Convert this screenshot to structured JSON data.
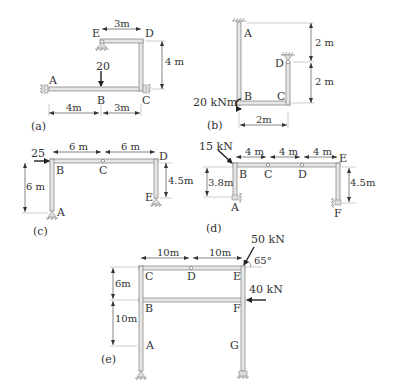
{
  "figures": [
    {
      "id": "a",
      "caption": "(a)",
      "nodes": [
        "A",
        "B",
        "C",
        "D",
        "E"
      ],
      "dimensions": {
        "ED": "3m",
        "CD": "4 m",
        "AB": "4m",
        "BC": "3m"
      },
      "loads": [
        {
          "label": "20",
          "at": "B",
          "direction": "down"
        }
      ]
    },
    {
      "id": "b",
      "caption": "(b)",
      "nodes": [
        "A",
        "B",
        "C",
        "D"
      ],
      "dimensions": {
        "upper": "2 m",
        "lower": "2 m",
        "BC": "2m"
      },
      "loads": [
        {
          "label": "20 kNm",
          "at": "B",
          "type": "moment"
        }
      ]
    },
    {
      "id": "c",
      "caption": "(c)",
      "nodes": [
        "A",
        "B",
        "C",
        "D",
        "E"
      ],
      "dimensions": {
        "BC": "6 m",
        "CD": "6 m",
        "AB": "6 m",
        "DE": "4.5m"
      },
      "loads": [
        {
          "label": "25",
          "at": "B",
          "direction": "right"
        }
      ]
    },
    {
      "id": "d",
      "caption": "(d)",
      "nodes": [
        "A",
        "B",
        "C",
        "D",
        "E",
        "F"
      ],
      "dimensions": {
        "BC": "4 m",
        "CD": "4 m",
        "DE": "4 m",
        "AB": "3.8m",
        "EF": "4.5m"
      },
      "loads": [
        {
          "label": "15 kN",
          "at": "B",
          "direction": "diagonal"
        }
      ]
    },
    {
      "id": "e",
      "caption": "(e)",
      "nodes": [
        "A",
        "B",
        "C",
        "D",
        "E",
        "F",
        "G"
      ],
      "dimensions": {
        "CD": "10m",
        "DE": "10m",
        "BC": "6m",
        "AB": "10m"
      },
      "loads": [
        {
          "label": "50 kN",
          "at": "E",
          "angle": "65°"
        },
        {
          "label": "40 kN",
          "at": "F",
          "direction": "left"
        }
      ]
    }
  ],
  "text": {
    "a": {
      "A": "A",
      "B": "B",
      "C": "C",
      "D": "D",
      "E": "E",
      "d_ed": "3m",
      "d_cd": "4 m",
      "d_ab": "4m",
      "d_bc": "3m",
      "load": "20",
      "cap": "(a)"
    },
    "b": {
      "A": "A",
      "B": "B",
      "C": "C",
      "D": "D",
      "d_top": "2 m",
      "d_bot": "2 m",
      "d_bc": "2m",
      "load": "20 kNm",
      "cap": "(b)"
    },
    "c": {
      "A": "A",
      "B": "B",
      "C": "C",
      "D": "D",
      "E": "E",
      "d_bc": "6 m",
      "d_cd": "6 m",
      "d_ab": "6 m",
      "d_de": "4.5m",
      "load": "25",
      "cap": "(c)"
    },
    "d": {
      "A": "A",
      "B": "B",
      "C": "C",
      "D": "D",
      "E": "E",
      "F": "F",
      "d_bc": "4 m",
      "d_cd": "4 m",
      "d_de": "4 m",
      "d_ab": "3.8m",
      "d_ef": "4.5m",
      "load": "15 kN",
      "cap": "(d)"
    },
    "e": {
      "A": "A",
      "B": "B",
      "C": "C",
      "D": "D",
      "E": "E",
      "F": "F",
      "G": "G",
      "d_cd": "10m",
      "d_de": "10m",
      "d_bc": "6m",
      "d_ab": "10m",
      "load1": "50 kN",
      "angle": "65°",
      "load2": "40 kN",
      "cap": "(e)"
    }
  }
}
